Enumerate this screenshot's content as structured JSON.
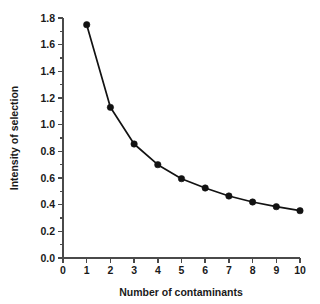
{
  "chart_data": {
    "type": "line",
    "title": "",
    "xlabel": "Number of contaminants",
    "ylabel": "Intensity of selection",
    "x": [
      1,
      2,
      3,
      4,
      5,
      6,
      7,
      8,
      9,
      10
    ],
    "values": [
      1.75,
      1.13,
      0.855,
      0.7,
      0.595,
      0.525,
      0.465,
      0.42,
      0.385,
      0.355
    ],
    "series": [
      {
        "name": "Intensity of selection",
        "values": [
          1.75,
          1.13,
          0.855,
          0.7,
          0.595,
          0.525,
          0.465,
          0.42,
          0.385,
          0.355
        ]
      }
    ],
    "xlim": [
      0,
      10
    ],
    "ylim": [
      0.0,
      1.8
    ],
    "xticks": [
      0,
      1,
      2,
      3,
      4,
      5,
      6,
      7,
      8,
      9,
      10
    ],
    "xticklabels": [
      "0",
      "1",
      "2",
      "3",
      "4",
      "5",
      "6",
      "7",
      "8",
      "9",
      "10"
    ],
    "yticks": [
      0.0,
      0.2,
      0.4,
      0.6,
      0.8,
      1.0,
      1.2,
      1.4,
      1.6,
      1.8
    ],
    "yticklabels": [
      "0.0",
      "0.2",
      "0.4",
      "0.6",
      "0.8",
      "1.0",
      "1.2",
      "1.4",
      "1.6",
      "1.8"
    ],
    "y_minor_interval": 0.1,
    "grid": false,
    "legend": false,
    "legend_position": "none",
    "marker": "filled-circle",
    "line_color": "#121212",
    "marker_color": "#121212",
    "axis_color": "#4a4a4a",
    "background_color": "#ffffff"
  },
  "axes": {
    "x_title": "Number of contaminants",
    "y_title": "Intensity of selection"
  }
}
